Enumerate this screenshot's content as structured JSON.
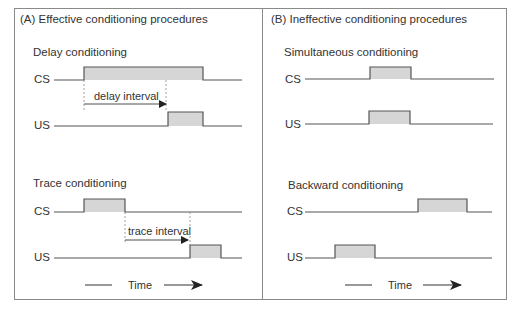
{
  "panels": [
    {
      "title": "(A) Effective conditioning procedures",
      "procedures": [
        {
          "name": "Delay conditioning",
          "cs_label": "CS",
          "us_label": "US",
          "interval_label": "delay interval"
        },
        {
          "name": "Trace conditioning",
          "cs_label": "CS",
          "us_label": "US",
          "interval_label": "trace interval"
        }
      ],
      "time_label": "Time"
    },
    {
      "title": "(B) Ineffective conditioning procedures",
      "procedures": [
        {
          "name": "Simultaneous conditioning",
          "cs_label": "CS",
          "us_label": "US"
        },
        {
          "name": "Backward conditioning",
          "cs_label": "CS",
          "us_label": "US"
        }
      ],
      "time_label": "Time"
    }
  ],
  "colors": {
    "line": "#555555",
    "pulse_fill": "#d6d6d6",
    "border": "#8a8a8a",
    "dashed": "#888888",
    "arrow": "#222222"
  }
}
